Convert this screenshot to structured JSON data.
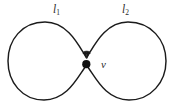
{
  "figure": {
    "kind": "wedge-of-two-circles",
    "background_color": "#ffffff",
    "stroke_color": "#1b1b1b",
    "vertex_color": "#111111",
    "label_color": "#2b2b2b"
  },
  "labels": {
    "loop_1": {
      "base": "l",
      "subscript": "1"
    },
    "loop_2": {
      "base": "l",
      "subscript": "2"
    },
    "vertex": "v"
  },
  "geometry": {
    "canvas": {
      "width": 174,
      "height": 104
    },
    "left_circle": {
      "cx": 47,
      "cy": 61,
      "r": 39
    },
    "right_circle": {
      "cx": 126,
      "cy": 61,
      "r": 40
    },
    "vertex_point": {
      "x": 86,
      "y": 64,
      "r": 4
    },
    "arrow_direction": "down"
  }
}
